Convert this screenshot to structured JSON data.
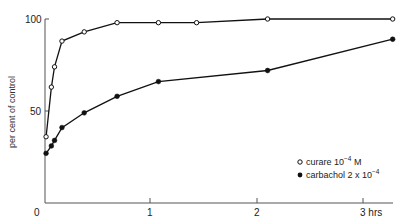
{
  "chart_data": {
    "type": "line",
    "title": "",
    "xlabel": "hrs",
    "ylabel": "per cent of control",
    "xlim": [
      0,
      3.3
    ],
    "ylim": [
      0,
      100
    ],
    "grid": false,
    "legend_position": "lower right",
    "x_ticks": [
      {
        "value": 0,
        "label": "0"
      },
      {
        "value": 1,
        "label": "1"
      },
      {
        "value": 2,
        "label": "2"
      },
      {
        "value": 3,
        "label": "3 hrs"
      }
    ],
    "y_ticks": [
      {
        "value": 50,
        "label": "50"
      },
      {
        "value": 100,
        "label": "100"
      }
    ],
    "series": [
      {
        "name": "curare 10-4 M",
        "legend_base": "curare 10",
        "legend_exp": "−4",
        "legend_suffix": "  M",
        "marker": "open-circle",
        "x": [
          0.01,
          0.06,
          0.09,
          0.16,
          0.37,
          0.68,
          1.07,
          1.43,
          2.1,
          3.28
        ],
        "values": [
          36,
          63,
          74,
          88,
          93,
          98,
          98,
          98,
          100,
          100
        ]
      },
      {
        "name": "carbachol 2 x 10-4",
        "legend_base": "carbachol 2 x 10",
        "legend_exp": "−4",
        "legend_suffix": "",
        "marker": "filled-circle",
        "x": [
          0.01,
          0.06,
          0.09,
          0.16,
          0.37,
          0.68,
          1.07,
          2.1,
          3.28
        ],
        "values": [
          27,
          31,
          34,
          41,
          49,
          58,
          66,
          72,
          89
        ]
      }
    ]
  }
}
